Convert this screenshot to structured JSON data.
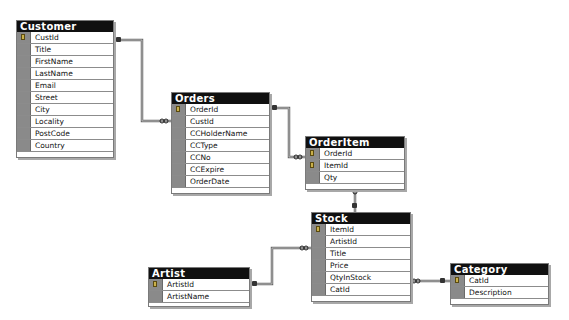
{
  "tables": {
    "customer": {
      "title": "Customer",
      "columns": [
        {
          "name": "CustId",
          "pk": true
        },
        {
          "name": "Title",
          "pk": false
        },
        {
          "name": "FirstName",
          "pk": false
        },
        {
          "name": "LastName",
          "pk": false
        },
        {
          "name": "Email",
          "pk": false
        },
        {
          "name": "Street",
          "pk": false
        },
        {
          "name": "City",
          "pk": false
        },
        {
          "name": "Locality",
          "pk": false
        },
        {
          "name": "PostCode",
          "pk": false
        },
        {
          "name": "Country",
          "pk": false
        }
      ]
    },
    "orders": {
      "title": "Orders",
      "columns": [
        {
          "name": "OrderId",
          "pk": true
        },
        {
          "name": "CustId",
          "pk": false
        },
        {
          "name": "CCHolderName",
          "pk": false
        },
        {
          "name": "CCType",
          "pk": false
        },
        {
          "name": "CCNo",
          "pk": false
        },
        {
          "name": "CCExpire",
          "pk": false
        },
        {
          "name": "OrderDate",
          "pk": false
        }
      ]
    },
    "orderitem": {
      "title": "OrderItem",
      "columns": [
        {
          "name": "OrderId",
          "pk": true
        },
        {
          "name": "ItemId",
          "pk": true
        },
        {
          "name": "Qty",
          "pk": false
        }
      ]
    },
    "stock": {
      "title": "Stock",
      "columns": [
        {
          "name": "ItemId",
          "pk": true
        },
        {
          "name": "ArtistId",
          "pk": false
        },
        {
          "name": "Title",
          "pk": false
        },
        {
          "name": "Price",
          "pk": false
        },
        {
          "name": "QtyInStock",
          "pk": false
        },
        {
          "name": "CatId",
          "pk": false
        }
      ]
    },
    "artist": {
      "title": "Artist",
      "columns": [
        {
          "name": "ArtistId",
          "pk": true
        },
        {
          "name": "ArtistName",
          "pk": false
        }
      ]
    },
    "category": {
      "title": "Category",
      "columns": [
        {
          "name": "CatId",
          "pk": true
        },
        {
          "name": "Description",
          "pk": false
        }
      ]
    }
  },
  "relationships": [
    {
      "from": "Customer.CustId",
      "to": "Orders.CustId",
      "type": "one-to-many"
    },
    {
      "from": "Orders.OrderId",
      "to": "OrderItem.OrderId",
      "type": "one-to-many"
    },
    {
      "from": "Stock.ItemId",
      "to": "OrderItem.ItemId",
      "type": "one-to-many"
    },
    {
      "from": "Artist.ArtistId",
      "to": "Stock.ArtistId",
      "type": "one-to-many"
    },
    {
      "from": "Category.CatId",
      "to": "Stock.CatId",
      "type": "one-to-many"
    }
  ],
  "colors": {
    "title_bar": "#101010",
    "key_cell": "#8a8a8a",
    "connector": "#707070"
  }
}
